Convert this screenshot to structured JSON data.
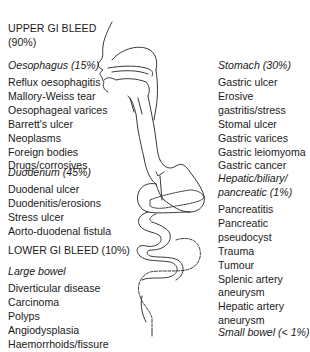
{
  "upper": {
    "title": "UPPER GI BLEED",
    "percent": "(90%)",
    "oesophagus": {
      "heading": "Oesophagus (15%)",
      "items": [
        "Reflux oesophagitis",
        "Mallory-Weiss tear",
        "Oesophageal varices",
        "Barrett's ulcer",
        "Neoplasms",
        "Foreign bodies",
        "Drugs/corrosives"
      ]
    },
    "duodenum": {
      "heading": "Duodenum (45%)",
      "items": [
        "Duodenal ulcer",
        "Duodenitis/erosions",
        "Stress ulcer",
        "Aorto-duodenal fistula"
      ]
    },
    "stomach": {
      "heading": "Stomach (30%)",
      "items": [
        "Gastric ulcer",
        "Erosive",
        "gastritis/stress",
        "Stomal ulcer",
        "Gastric varices",
        "Gastric leiomyoma",
        "Gastric cancer"
      ]
    },
    "hepatic": {
      "heading_line1": "Hepatic/biliary/",
      "heading_line2": "pancreatic (1%)",
      "items": [
        "Pancreatitis",
        "Pancreatic",
        "pseudocyst",
        "Trauma",
        "Tumour",
        "Splenic artery",
        "aneurysm",
        "Hepatic artery",
        "aneurysm"
      ]
    }
  },
  "lower": {
    "title": "LOWER GI BLEED (10%)",
    "large_bowel": {
      "heading": "Large bowel",
      "items": [
        "Diverticular disease",
        "Carcinoma",
        "Polyps",
        "Angiodysplasia",
        "Haemorrhoids/fissure"
      ]
    },
    "small_bowel": {
      "heading": "Small bowel (< 1%)"
    }
  }
}
